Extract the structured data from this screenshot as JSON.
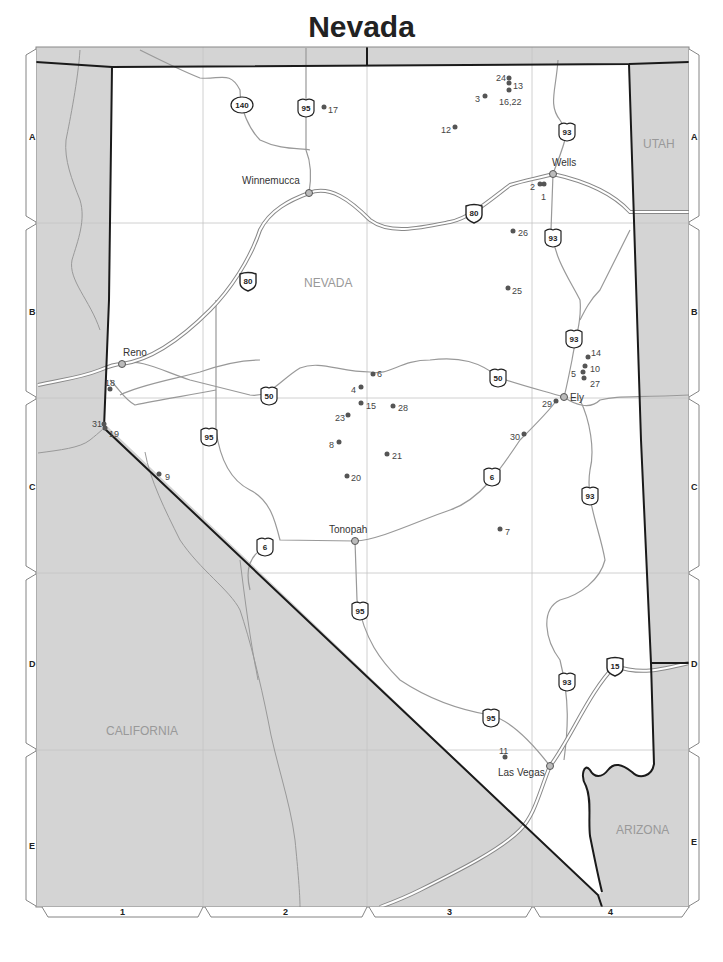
{
  "title": "Nevada",
  "state_labels": {
    "nevada": "NEVADA",
    "utah": "UTAH",
    "california": "CALIFORNIA",
    "arizona": "ARIZONA"
  },
  "grid": {
    "columns": [
      "1",
      "2",
      "3",
      "4"
    ],
    "rows": [
      "A",
      "B",
      "C",
      "D",
      "E"
    ]
  },
  "cities": [
    {
      "name": "Winnemucca",
      "x": 309,
      "y": 193
    },
    {
      "name": "Wells",
      "x": 553,
      "y": 174
    },
    {
      "name": "Reno",
      "x": 122,
      "y": 364
    },
    {
      "name": "Ely",
      "x": 564,
      "y": 397
    },
    {
      "name": "Tonopah",
      "x": 355,
      "y": 541
    },
    {
      "name": "Las Vegas",
      "x": 550,
      "y": 766
    }
  ],
  "highways": [
    {
      "type": "state",
      "number": "140",
      "x": 242,
      "y": 105
    },
    {
      "type": "us",
      "number": "95",
      "x": 306,
      "y": 108
    },
    {
      "type": "us",
      "number": "93",
      "x": 567,
      "y": 132
    },
    {
      "type": "interstate",
      "number": "80",
      "x": 474,
      "y": 213
    },
    {
      "type": "us",
      "number": "93",
      "x": 553,
      "y": 238
    },
    {
      "type": "interstate",
      "number": "80",
      "x": 248,
      "y": 281
    },
    {
      "type": "us",
      "number": "93",
      "x": 574,
      "y": 339
    },
    {
      "type": "us",
      "number": "50",
      "x": 498,
      "y": 378
    },
    {
      "type": "us",
      "number": "50",
      "x": 269,
      "y": 396
    },
    {
      "type": "us",
      "number": "95",
      "x": 209,
      "y": 437
    },
    {
      "type": "us",
      "number": "6",
      "x": 492,
      "y": 477
    },
    {
      "type": "us",
      "number": "93",
      "x": 590,
      "y": 496
    },
    {
      "type": "us",
      "number": "6",
      "x": 265,
      "y": 547
    },
    {
      "type": "us",
      "number": "95",
      "x": 360,
      "y": 611
    },
    {
      "type": "us",
      "number": "93",
      "x": 567,
      "y": 682
    },
    {
      "type": "interstate",
      "number": "15",
      "x": 615,
      "y": 666
    },
    {
      "type": "us",
      "number": "95",
      "x": 491,
      "y": 718
    }
  ],
  "sites": [
    {
      "label": "1",
      "x": 544,
      "y": 184,
      "lx": 541,
      "ly": 197
    },
    {
      "label": "2",
      "x": 540,
      "y": 184,
      "lx": 530,
      "ly": 187
    },
    {
      "label": "3",
      "x": 485,
      "y": 96,
      "lx": 475,
      "ly": 99
    },
    {
      "label": "4",
      "x": 361,
      "y": 387,
      "lx": 351,
      "ly": 390
    },
    {
      "label": "5",
      "x": 583,
      "y": 372,
      "lx": 571,
      "ly": 374
    },
    {
      "label": "6",
      "x": 373,
      "y": 374,
      "lx": 377,
      "ly": 374
    },
    {
      "label": "7",
      "x": 500,
      "y": 529,
      "lx": 505,
      "ly": 532
    },
    {
      "label": "8",
      "x": 339,
      "y": 442,
      "lx": 329,
      "ly": 445
    },
    {
      "label": "9",
      "x": 159,
      "y": 474,
      "lx": 165,
      "ly": 477
    },
    {
      "label": "10",
      "x": 585,
      "y": 366,
      "lx": 590,
      "ly": 369
    },
    {
      "label": "11",
      "x": 505,
      "y": 757,
      "lx": 499,
      "ly": 751
    },
    {
      "label": "12",
      "x": 455,
      "y": 127,
      "lx": 441,
      "ly": 130
    },
    {
      "label": "13",
      "x": 509,
      "y": 83,
      "lx": 513,
      "ly": 86
    },
    {
      "label": "14",
      "x": 588,
      "y": 357,
      "lx": 591,
      "ly": 353
    },
    {
      "label": "15",
      "x": 361,
      "y": 403,
      "lx": 366,
      "ly": 406
    },
    {
      "label": "16,22",
      "x": 509,
      "y": 90,
      "lx": 499,
      "ly": 102
    },
    {
      "label": "17",
      "x": 324,
      "y": 107,
      "lx": 328,
      "ly": 110
    },
    {
      "label": "18",
      "x": 110,
      "y": 389,
      "lx": 105,
      "ly": 383
    },
    {
      "label": "19",
      "x": 105,
      "y": 428,
      "lx": 109,
      "ly": 434
    },
    {
      "label": "20",
      "x": 347,
      "y": 476,
      "lx": 351,
      "ly": 478
    },
    {
      "label": "21",
      "x": 387,
      "y": 454,
      "lx": 392,
      "ly": 456
    },
    {
      "label": "23",
      "x": 348,
      "y": 415,
      "lx": 335,
      "ly": 418
    },
    {
      "label": "24",
      "x": 509,
      "y": 78,
      "lx": 496,
      "ly": 78
    },
    {
      "label": "25",
      "x": 508,
      "y": 288,
      "lx": 512,
      "ly": 291
    },
    {
      "label": "26",
      "x": 513,
      "y": 231,
      "lx": 518,
      "ly": 233
    },
    {
      "label": "27",
      "x": 584,
      "y": 378,
      "lx": 590,
      "ly": 384
    },
    {
      "label": "28",
      "x": 393,
      "y": 406,
      "lx": 398,
      "ly": 408
    },
    {
      "label": "29",
      "x": 556,
      "y": 401,
      "lx": 542,
      "ly": 404
    },
    {
      "label": "30",
      "x": 524,
      "y": 434,
      "lx": 510,
      "ly": 437
    },
    {
      "label": "31",
      "x": 104,
      "y": 424,
      "lx": 92,
      "ly": 424
    }
  ],
  "colors": {
    "neighbor_fill": "#d4d4d4",
    "nevada_fill": "#ffffff",
    "border": "#1a1a1a",
    "road": "#999999",
    "grid_line": "#c8c8c8",
    "site_dot": "#555555"
  }
}
